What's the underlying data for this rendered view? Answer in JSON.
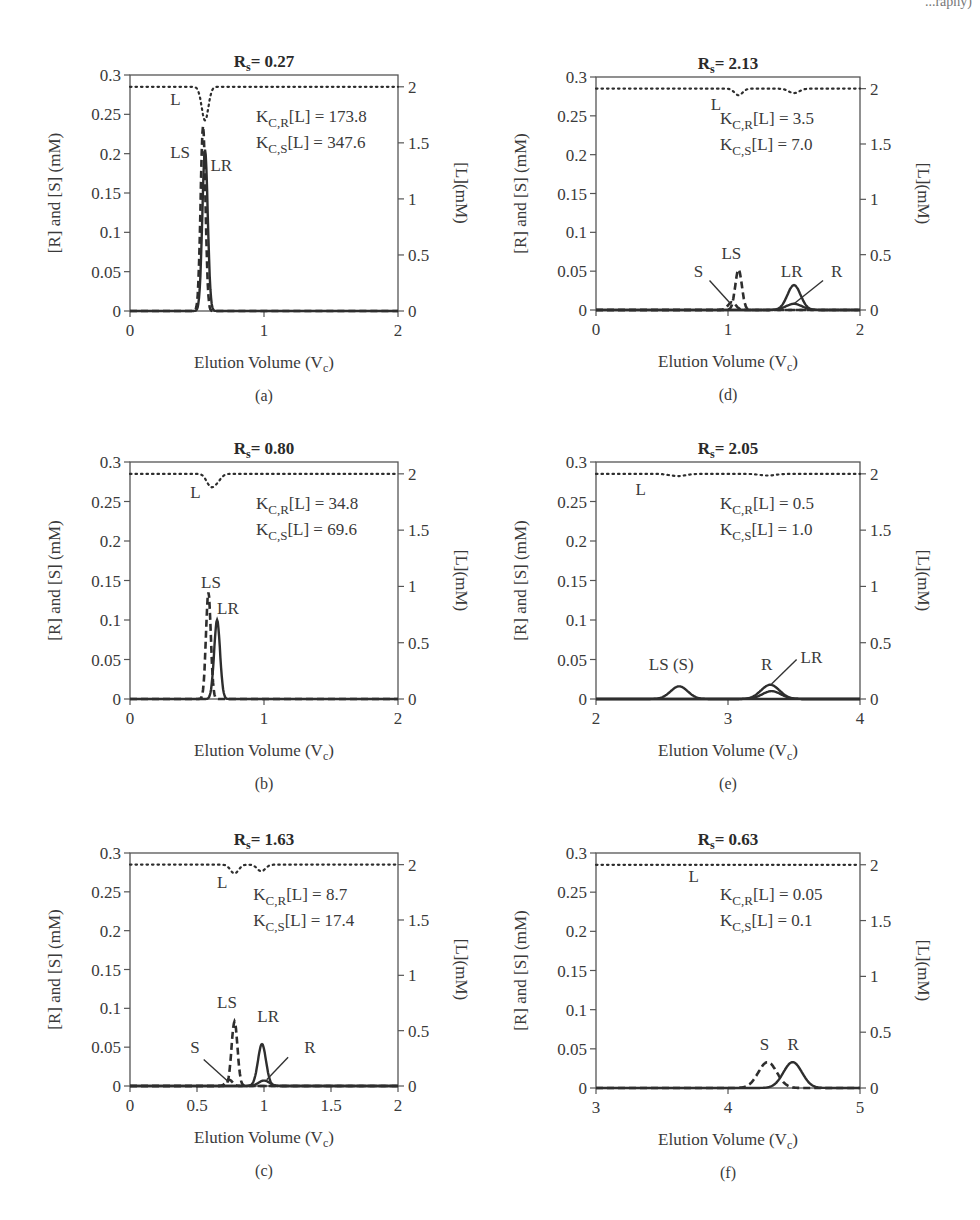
{
  "header": {
    "corner_fragment": "...raphy)"
  },
  "chart_data": [
    {
      "id": "a",
      "type": "line",
      "caption": "(a)",
      "title": "R_s = 0.27",
      "title_main": "R",
      "title_sub": "s",
      "title_value": "= 0.27",
      "xlabel": "Elution Volume (V_c)",
      "ylabel": "[R] and [S] (mM)",
      "y2label": "[L](mM)",
      "xlim": [
        0,
        2
      ],
      "ylim": [
        0,
        0.3
      ],
      "y2lim": [
        0,
        2.0
      ],
      "xticks": [
        0,
        1,
        2
      ],
      "xtick_labels": [
        "0",
        "1",
        "2"
      ],
      "yticks": [
        0,
        0.05,
        0.1,
        0.15,
        0.2,
        0.25,
        0.3
      ],
      "ytick_labels": [
        "0",
        "0.05",
        "0.1",
        "0.15",
        "0.2",
        "0.25",
        "0.3"
      ],
      "y2ticks": [
        0,
        0.5,
        1,
        1.5,
        2
      ],
      "y2tick_labels": [
        "0",
        "0.5",
        "1",
        "1.5",
        "2"
      ],
      "params": {
        "KCR_L": "173.8",
        "KCS_L": "347.6"
      },
      "annot_lines": [
        "K_C,R[L] = 173.8",
        "K_C,S[L] = 347.6"
      ],
      "series": [
        {
          "name": "L",
          "axis": "y2",
          "style": "dotted",
          "baseline": 2.0,
          "dips": [
            {
              "center": 0.56,
              "depth": 0.3,
              "width": 0.025
            }
          ]
        },
        {
          "name": "LS",
          "axis": "y1",
          "style": "dashed",
          "peaks": [
            {
              "center": 0.545,
              "height": 0.235,
              "width": 0.018
            }
          ]
        },
        {
          "name": "LR",
          "axis": "y1",
          "style": "solid",
          "peaks": [
            {
              "center": 0.56,
              "height": 0.205,
              "width": 0.02
            }
          ]
        }
      ],
      "labels": [
        {
          "text": "L",
          "x": 0.3,
          "y": 0.262
        },
        {
          "text": "LS",
          "x": 0.3,
          "y": 0.195
        },
        {
          "text": "LR",
          "x": 0.6,
          "y": 0.178
        }
      ]
    },
    {
      "id": "b",
      "type": "line",
      "caption": "(b)",
      "title": "R_s = 0.80",
      "title_main": "R",
      "title_sub": "s",
      "title_value": "= 0.80",
      "xlabel": "Elution Volume (V_c)",
      "ylabel": "[R] and [S] (mM)",
      "y2label": "[L](mM)",
      "xlim": [
        0,
        2
      ],
      "ylim": [
        0,
        0.3
      ],
      "y2lim": [
        0,
        2.0
      ],
      "xticks": [
        0,
        1,
        2
      ],
      "xtick_labels": [
        "0",
        "1",
        "2"
      ],
      "yticks": [
        0,
        0.05,
        0.1,
        0.15,
        0.2,
        0.25,
        0.3
      ],
      "ytick_labels": [
        "0",
        "0.05",
        "0.1",
        "0.15",
        "0.2",
        "0.25",
        "0.3"
      ],
      "y2ticks": [
        0,
        0.5,
        1,
        1.5,
        2
      ],
      "y2tick_labels": [
        "0",
        "0.5",
        "1",
        "1.5",
        "2"
      ],
      "params": {
        "KCR_L": "34.8",
        "KCS_L": "69.6"
      },
      "annot_lines": [
        "K_C,R[L] = 34.8",
        "K_C,S[L] = 69.6"
      ],
      "series": [
        {
          "name": "L",
          "axis": "y2",
          "style": "dotted",
          "baseline": 2.0,
          "dips": [
            {
              "center": 0.6,
              "depth": 0.1,
              "width": 0.03
            },
            {
              "center": 0.65,
              "depth": 0.06,
              "width": 0.03
            }
          ]
        },
        {
          "name": "LS",
          "axis": "y1",
          "style": "dashed",
          "peaks": [
            {
              "center": 0.585,
              "height": 0.135,
              "width": 0.018
            }
          ]
        },
        {
          "name": "LR",
          "axis": "y1",
          "style": "solid",
          "peaks": [
            {
              "center": 0.65,
              "height": 0.1,
              "width": 0.022
            }
          ]
        }
      ],
      "labels": [
        {
          "text": "L",
          "x": 0.45,
          "y": 0.255
        },
        {
          "text": "LS",
          "x": 0.53,
          "y": 0.14
        },
        {
          "text": "LR",
          "x": 0.65,
          "y": 0.107
        }
      ]
    },
    {
      "id": "c",
      "type": "line",
      "caption": "(c)",
      "title": "R_s = 1.63",
      "title_main": "R",
      "title_sub": "s",
      "title_value": "= 1.63",
      "xlabel": "Elution Volume (V_c)",
      "ylabel": "[R] and [S] (mM)",
      "y2label": "[L](mM)",
      "xlim": [
        0,
        2
      ],
      "ylim": [
        0,
        0.3
      ],
      "y2lim": [
        0,
        2.0
      ],
      "xticks": [
        0,
        0.5,
        1,
        1.5,
        2
      ],
      "xtick_labels": [
        "0",
        "0.5",
        "1",
        "1.5",
        "2"
      ],
      "yticks": [
        0,
        0.05,
        0.1,
        0.15,
        0.2,
        0.25,
        0.3
      ],
      "ytick_labels": [
        "0",
        "0.05",
        "0.1",
        "0.15",
        "0.2",
        "0.25",
        "0.3"
      ],
      "y2ticks": [
        0,
        0.5,
        1,
        1.5,
        2
      ],
      "y2tick_labels": [
        "0",
        "0.5",
        "1",
        "1.5",
        "2"
      ],
      "params": {
        "KCR_L": "8.7",
        "KCS_L": "17.4"
      },
      "annot_lines": [
        "K_C,R[L] = 8.7",
        "K_C,S[L] = 17.4"
      ],
      "series": [
        {
          "name": "L",
          "axis": "y2",
          "style": "dotted",
          "baseline": 2.0,
          "dips": [
            {
              "center": 0.78,
              "depth": 0.08,
              "width": 0.03
            },
            {
              "center": 0.98,
              "depth": 0.06,
              "width": 0.03
            }
          ]
        },
        {
          "name": "S",
          "axis": "y1",
          "style": "dashed",
          "peaks": [
            {
              "center": 0.74,
              "height": 0.008,
              "width": 0.025
            }
          ]
        },
        {
          "name": "LS",
          "axis": "y1",
          "style": "dashed",
          "peaks": [
            {
              "center": 0.78,
              "height": 0.083,
              "width": 0.022
            }
          ]
        },
        {
          "name": "LR",
          "axis": "y1",
          "style": "solid",
          "peaks": [
            {
              "center": 0.985,
              "height": 0.054,
              "width": 0.03
            }
          ]
        },
        {
          "name": "R",
          "axis": "y1",
          "style": "solid",
          "peaks": [
            {
              "center": 1.0,
              "height": 0.007,
              "width": 0.04
            }
          ]
        }
      ],
      "labels": [
        {
          "text": "L",
          "x": 0.65,
          "y": 0.255
        },
        {
          "text": "LS",
          "x": 0.65,
          "y": 0.1
        },
        {
          "text": "LR",
          "x": 0.95,
          "y": 0.082
        },
        {
          "text": "S",
          "x": 0.45,
          "y": 0.042
        },
        {
          "text": "R",
          "x": 1.3,
          "y": 0.042
        }
      ],
      "leaders": [
        {
          "from": [
            0.55,
            0.034
          ],
          "to": [
            0.73,
            0.006
          ]
        },
        {
          "from": [
            1.18,
            0.037
          ],
          "to": [
            1.02,
            0.008
          ]
        }
      ]
    },
    {
      "id": "d",
      "type": "line",
      "caption": "(d)",
      "title": "R_s = 2.13",
      "title_main": "R",
      "title_sub": "s",
      "title_value": "= 2.13",
      "xlabel": "Elution Volume (V_c)",
      "ylabel": "[R] and [S] (mM)",
      "y2label": "[L](mM)",
      "xlim": [
        0,
        2
      ],
      "ylim": [
        0,
        0.3
      ],
      "y2lim": [
        0,
        2.0
      ],
      "xticks": [
        0,
        1,
        2
      ],
      "xtick_labels": [
        "0",
        "1",
        "2"
      ],
      "yticks": [
        0,
        0.05,
        0.1,
        0.15,
        0.2,
        0.25,
        0.3
      ],
      "ytick_labels": [
        "0",
        "0.05",
        "0.1",
        "0.15",
        "0.2",
        "0.25",
        "0.3"
      ],
      "y2ticks": [
        0,
        0.5,
        1,
        1.5,
        2
      ],
      "y2tick_labels": [
        "0",
        "0.5",
        "1",
        "1.5",
        "2"
      ],
      "params": {
        "KCR_L": "3.5",
        "KCS_L": "7.0"
      },
      "annot_lines": [
        "K_C,R[L] = 3.5",
        "K_C,S[L] = 7.0"
      ],
      "series": [
        {
          "name": "L",
          "axis": "y2",
          "style": "dotted",
          "baseline": 2.0,
          "dips": [
            {
              "center": 1.08,
              "depth": 0.06,
              "width": 0.03
            },
            {
              "center": 1.5,
              "depth": 0.04,
              "width": 0.04
            }
          ]
        },
        {
          "name": "S",
          "axis": "y1",
          "style": "dashed",
          "peaks": [
            {
              "center": 1.03,
              "height": 0.01,
              "width": 0.03
            }
          ]
        },
        {
          "name": "LS",
          "axis": "y1",
          "style": "dashed",
          "peaks": [
            {
              "center": 1.08,
              "height": 0.052,
              "width": 0.025
            }
          ]
        },
        {
          "name": "LR",
          "axis": "y1",
          "style": "solid",
          "peaks": [
            {
              "center": 1.5,
              "height": 0.032,
              "width": 0.05
            }
          ]
        },
        {
          "name": "R",
          "axis": "y1",
          "style": "solid",
          "peaks": [
            {
              "center": 1.5,
              "height": 0.008,
              "width": 0.06
            }
          ]
        }
      ],
      "labels": [
        {
          "text": "L",
          "x": 0.87,
          "y": 0.258
        },
        {
          "text": "LS",
          "x": 0.95,
          "y": 0.066
        },
        {
          "text": "LR",
          "x": 1.4,
          "y": 0.042
        },
        {
          "text": "S",
          "x": 0.74,
          "y": 0.042
        },
        {
          "text": "R",
          "x": 1.78,
          "y": 0.042
        }
      ],
      "leaders": [
        {
          "from": [
            0.86,
            0.038
          ],
          "to": [
            1.02,
            0.008
          ]
        },
        {
          "from": [
            1.72,
            0.038
          ],
          "to": [
            1.5,
            0.008
          ]
        }
      ]
    },
    {
      "id": "e",
      "type": "line",
      "caption": "(e)",
      "title": "R_s = 2.05",
      "title_main": "R",
      "title_sub": "s",
      "title_value": "= 2.05",
      "xlabel": "Elution Volume (V_c)",
      "ylabel": "[R] and [S] (mM)",
      "y2label": "[L](mM)",
      "xlim": [
        2,
        4
      ],
      "ylim": [
        0,
        0.3
      ],
      "y2lim": [
        0,
        2.0
      ],
      "xticks": [
        2,
        3,
        4
      ],
      "xtick_labels": [
        "2",
        "3",
        "4"
      ],
      "yticks": [
        0,
        0.05,
        0.1,
        0.15,
        0.2,
        0.25,
        0.3
      ],
      "ytick_labels": [
        "0",
        "0.05",
        "0.1",
        "0.15",
        "0.2",
        "0.25",
        "0.3"
      ],
      "y2ticks": [
        0,
        0.5,
        1,
        1.5,
        2
      ],
      "y2tick_labels": [
        "0",
        "0.5",
        "1",
        "1.5",
        "2"
      ],
      "params": {
        "KCR_L": "0.5",
        "KCS_L": "1.0"
      },
      "annot_lines": [
        "K_C,R[L] = 0.5",
        "K_C,S[L] = 1.0"
      ],
      "series": [
        {
          "name": "L",
          "axis": "y2",
          "style": "dotted",
          "baseline": 2.0,
          "dips": [
            {
              "center": 2.62,
              "depth": 0.02,
              "width": 0.06
            },
            {
              "center": 3.3,
              "depth": 0.015,
              "width": 0.06
            }
          ]
        },
        {
          "name": "LS (S)",
          "axis": "y1",
          "style": "solid",
          "peaks": [
            {
              "center": 2.63,
              "height": 0.016,
              "width": 0.065
            }
          ]
        },
        {
          "name": "R",
          "axis": "y1",
          "style": "solid",
          "peaks": [
            {
              "center": 3.32,
              "height": 0.018,
              "width": 0.07
            }
          ]
        },
        {
          "name": "LR",
          "axis": "y1",
          "style": "solid",
          "peaks": [
            {
              "center": 3.33,
              "height": 0.01,
              "width": 0.07
            }
          ]
        }
      ],
      "labels": [
        {
          "text": "L",
          "x": 2.3,
          "y": 0.258
        },
        {
          "text": "LS (S)",
          "x": 2.4,
          "y": 0.037
        },
        {
          "text": "R",
          "x": 3.25,
          "y": 0.037
        },
        {
          "text": "LR",
          "x": 3.55,
          "y": 0.045
        }
      ],
      "leaders": [
        {
          "from": [
            3.52,
            0.05
          ],
          "to": [
            3.33,
            0.019
          ]
        }
      ]
    },
    {
      "id": "f",
      "type": "line",
      "caption": "(f)",
      "title": "R_s = 0.63",
      "title_main": "R",
      "title_sub": "s",
      "title_value": "= 0.63",
      "xlabel": "Elution Volume (V_c)",
      "ylabel": "[R] and [S] (mM)",
      "y2label": "[L](mM)",
      "xlim": [
        3,
        5
      ],
      "ylim": [
        0,
        0.3
      ],
      "y2lim": [
        0,
        2.0
      ],
      "xticks": [
        3,
        4,
        5
      ],
      "xtick_labels": [
        "3",
        "4",
        "5"
      ],
      "yticks": [
        0,
        0.05,
        0.1,
        0.15,
        0.2,
        0.25,
        0.3
      ],
      "ytick_labels": [
        "0",
        "0.05",
        "0.1",
        "0.15",
        "0.2",
        "0.25",
        "0.3"
      ],
      "y2ticks": [
        0,
        0.5,
        1,
        1.5,
        2
      ],
      "y2tick_labels": [
        "0",
        "0.5",
        "1",
        "1.5",
        "2"
      ],
      "params": {
        "KCR_L": "0.05",
        "KCS_L": "0.1"
      },
      "annot_lines": [
        "K_C,R[L] = 0.05",
        "K_C,S[L] = 0.1"
      ],
      "series": [
        {
          "name": "L",
          "axis": "y2",
          "style": "dotted",
          "baseline": 2.0,
          "dips": []
        },
        {
          "name": "S",
          "axis": "y1",
          "style": "dashed",
          "peaks": [
            {
              "center": 4.3,
              "height": 0.033,
              "width": 0.07
            }
          ]
        },
        {
          "name": "R",
          "axis": "y1",
          "style": "solid",
          "peaks": [
            {
              "center": 4.49,
              "height": 0.033,
              "width": 0.07
            }
          ]
        }
      ],
      "labels": [
        {
          "text": "L",
          "x": 3.7,
          "y": 0.263
        },
        {
          "text": "S",
          "x": 4.24,
          "y": 0.048
        },
        {
          "text": "R",
          "x": 4.45,
          "y": 0.048
        }
      ]
    }
  ]
}
